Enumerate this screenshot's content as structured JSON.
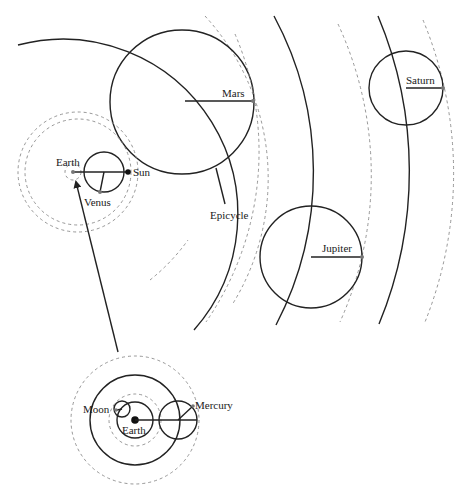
{
  "diagram": {
    "labels": {
      "mars": "Mars",
      "epicycle": "Epicycle",
      "earth": "Earth",
      "sun": "Sun",
      "venus": "Venus",
      "jupiter": "Jupiter",
      "saturn": "Saturn",
      "inset_moon": "Moon",
      "inset_earth": "Earth",
      "inset_mercury": "Mercury"
    },
    "colors": {
      "solid_stroke": "#222222",
      "dashed_stroke": "#8a8a8a",
      "background": "#ffffff"
    }
  }
}
